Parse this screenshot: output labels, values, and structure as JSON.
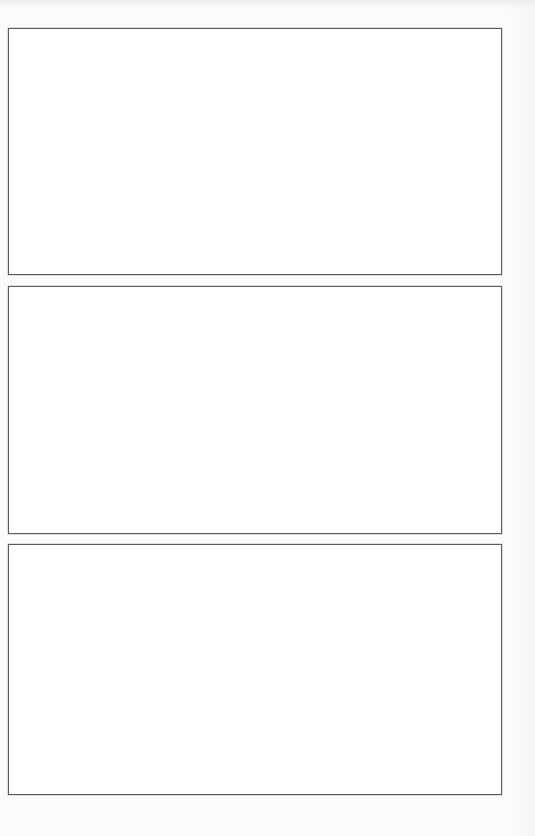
{
  "page": {
    "background_color": "#fbfbfb",
    "frame_border_color": "#5a5a5a",
    "frame_fill_color": "#ffffff"
  },
  "frames": [
    {
      "left": 8,
      "top": 28,
      "width": 494,
      "height": 247
    },
    {
      "left": 8,
      "top": 286,
      "width": 494,
      "height": 248
    },
    {
      "left": 8,
      "top": 544,
      "width": 494,
      "height": 251
    }
  ]
}
